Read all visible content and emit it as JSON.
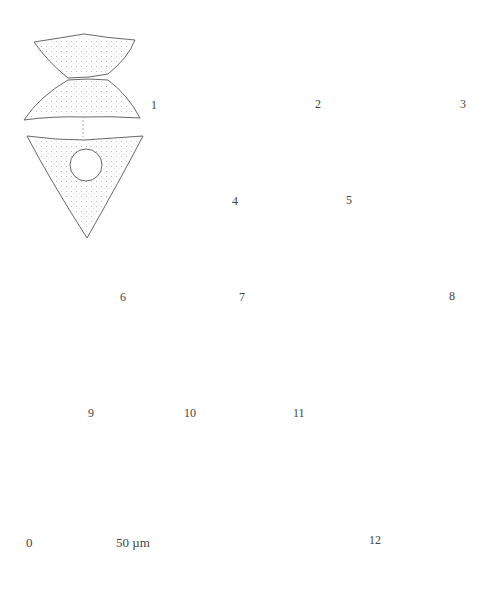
{
  "plate": {
    "figures": [
      {
        "id": 1,
        "label": "1",
        "views": [
          "front",
          "apical"
        ]
      },
      {
        "id": 2,
        "label": "2",
        "views": [
          "front"
        ]
      },
      {
        "id": 3,
        "label": "3",
        "views": [
          "front",
          "apical"
        ]
      },
      {
        "id": 4,
        "label": "4",
        "views": [
          "front"
        ]
      },
      {
        "id": 5,
        "label": "5",
        "views": [
          "front"
        ]
      },
      {
        "id": 6,
        "label": "6",
        "views": [
          "front"
        ]
      },
      {
        "id": 7,
        "label": "7",
        "views": [
          "front"
        ]
      },
      {
        "id": 8,
        "label": "8",
        "views": [
          "front",
          "apical"
        ]
      },
      {
        "id": 9,
        "label": "9",
        "views": [
          "front",
          "apical"
        ]
      },
      {
        "id": 10,
        "label": "10",
        "views": [
          "front",
          "apical"
        ]
      },
      {
        "id": 11,
        "label": "11",
        "views": [
          "front",
          "apical"
        ]
      },
      {
        "id": 12,
        "label": "12",
        "views": [
          "front"
        ]
      }
    ],
    "scale_bar": {
      "start_label": "0",
      "end_label": "50 µm",
      "ticks": 6
    },
    "colors": {
      "line": "#555555",
      "stipple": "#666666",
      "background": "#ffffff"
    }
  }
}
